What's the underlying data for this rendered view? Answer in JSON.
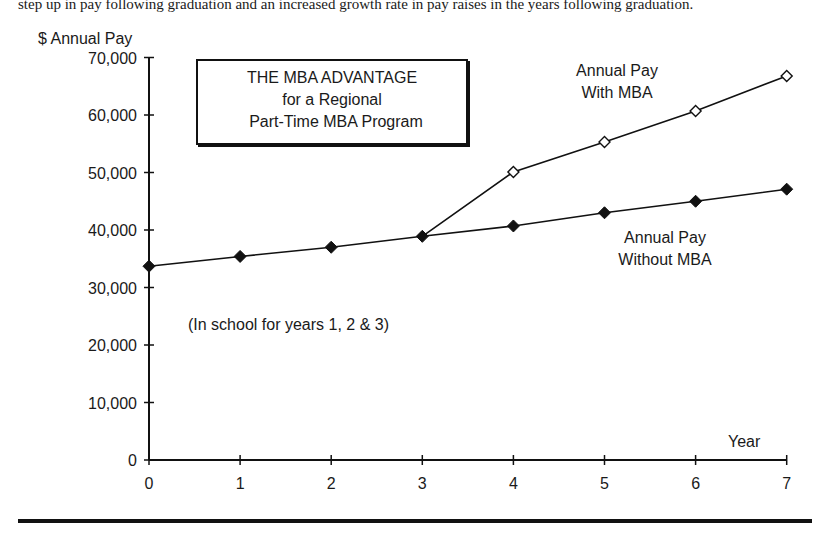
{
  "caption": "step up in pay following graduation and an increased growth rate in pay raises in the years following graduation.",
  "chart_data": {
    "type": "line",
    "title": "THE MBA ADVANTAGE for a Regional Part-Time MBA Program",
    "title_lines": [
      "THE MBA ADVANTAGE",
      "for a Regional",
      "Part-Time MBA Program"
    ],
    "xlabel": "Year",
    "ylabel": "$ Annual Pay",
    "x": [
      0,
      1,
      2,
      3,
      4,
      5,
      6,
      7
    ],
    "xticks": [
      "0",
      "1",
      "2",
      "3",
      "4",
      "5",
      "6",
      "7"
    ],
    "yticks": [
      "0",
      "10,000",
      "20,000",
      "30,000",
      "40,000",
      "50,000",
      "60,000",
      "70,000"
    ],
    "ylim": [
      0,
      70000
    ],
    "xlim": [
      0,
      7
    ],
    "grid": false,
    "series": [
      {
        "name": "Annual Pay Without MBA",
        "marker": "filled-diamond",
        "x": [
          0,
          1,
          2,
          3,
          4,
          5,
          6,
          7
        ],
        "values": [
          33700,
          35400,
          37000,
          38900,
          40700,
          43000,
          45000,
          47100
        ]
      },
      {
        "name": "Annual Pay With MBA",
        "marker": "open-diamond",
        "x": [
          3,
          4,
          5,
          6,
          7
        ],
        "values": [
          38900,
          50100,
          55300,
          60700,
          66800
        ]
      }
    ],
    "annotations": [
      "Annual Pay With MBA",
      "Annual Pay Without MBA",
      "(In school for years 1, 2 & 3)"
    ]
  },
  "labels": {
    "with_mba_line1": "Annual Pay",
    "with_mba_line2": "With MBA",
    "without_mba_line1": "Annual Pay",
    "without_mba_line2": "Without MBA",
    "school_note": "(In school for years 1, 2 & 3)",
    "year_label": "Year",
    "y_title": "$ Annual Pay"
  }
}
